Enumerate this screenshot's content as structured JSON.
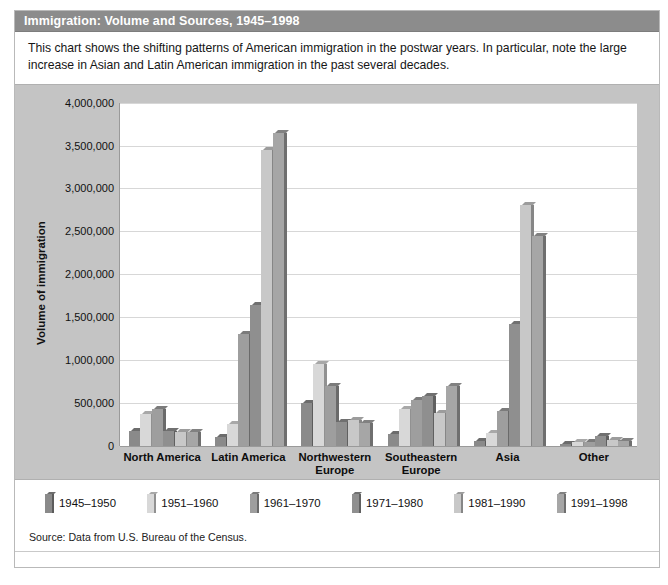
{
  "figure": {
    "title": "Immigration: Volume and Sources, 1945–1998",
    "caption": "This chart shows the shifting patterns of American immigration in the postwar years. In particular, note the large increase in Asian and Latin American immigration in the past several decades.",
    "source": "Source: Data from U.S. Bureau of the Census."
  },
  "chart_data": {
    "type": "bar",
    "title": "Immigration: Volume and Sources, 1945–1998",
    "xlabel": "",
    "ylabel": "Volume of immigration",
    "ylim": [
      0,
      4000000
    ],
    "ytick_labels": [
      "4,000,000",
      "3,500,000",
      "3,000,000",
      "2,500,000",
      "2,000,000",
      "1,500,000",
      "1,000,000",
      "500,000",
      "0"
    ],
    "ytick_values": [
      4000000,
      3500000,
      3000000,
      2500000,
      2000000,
      1500000,
      1000000,
      500000,
      0
    ],
    "grid": true,
    "legend_position": "bottom",
    "categories": [
      "North America",
      "Latin America",
      "Northwestern Europe",
      "Southeastern Europe",
      "Asia",
      "Other"
    ],
    "series": [
      {
        "name": "1945–1950",
        "color": "#8a8a8a",
        "values": [
          175000,
          100000,
          500000,
          140000,
          60000,
          25000
        ]
      },
      {
        "name": "1951–1960",
        "color": "#d8d8d8",
        "values": [
          375000,
          250000,
          950000,
          430000,
          150000,
          40000
        ]
      },
      {
        "name": "1961–1970",
        "color": "#9e9e9e",
        "values": [
          430000,
          1300000,
          700000,
          530000,
          400000,
          45000
        ]
      },
      {
        "name": "1971–1980",
        "color": "#8f8f8f",
        "values": [
          170000,
          1640000,
          280000,
          580000,
          1420000,
          110000
        ]
      },
      {
        "name": "1981–1990",
        "color": "#c8c8c8",
        "values": [
          160000,
          3450000,
          300000,
          380000,
          2810000,
          70000
        ]
      },
      {
        "name": "1991–1998",
        "color": "#a6a6a6",
        "values": [
          160000,
          3650000,
          260000,
          700000,
          2450000,
          60000
        ]
      }
    ]
  },
  "colors": {
    "title_bar": "#8c8c8c",
    "panel": "#c4c4c4",
    "plot": "#ffffff",
    "gridline": "#d7d7d7"
  }
}
